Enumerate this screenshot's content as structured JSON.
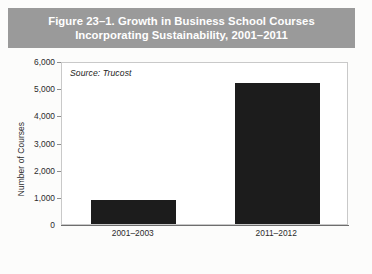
{
  "figure": {
    "title_line1": "Figure 23–1. Growth in Business School Courses",
    "title_line2": "Incorporating Sustainability, 2001–2011",
    "title_full": "Figure 23–1. Growth in Business School Courses\nIncorporating Sustainability, 2001–2011",
    "banner_color": "#9a9a9a",
    "title_color": "#ffffff",
    "background_color": "#fcfcfb"
  },
  "chart_data": {
    "type": "bar",
    "title": "Figure 23–1. Growth in Business School Courses Incorporating Sustainability, 2001–2011",
    "subtitle": "",
    "categories": [
      "2001–2003",
      "2011–2012"
    ],
    "values": [
      900,
      5200
    ],
    "series": [
      {
        "name": "Number of Courses",
        "values": [
          900,
          5200
        ]
      }
    ],
    "xlabel": "",
    "ylabel": "Number of Courses",
    "ylim": [
      0,
      6000
    ],
    "ytick_values": [
      0,
      1000,
      2000,
      3000,
      4000,
      5000,
      6000
    ],
    "ytick_labels": [
      "0",
      "1,000",
      "2,000",
      "3,000",
      "4,000",
      "5,000",
      "6,000"
    ],
    "grid": false,
    "legend": false,
    "legend_position": "none",
    "bar_color": "#1c1c1c",
    "plot_background": "#ffffff",
    "annotations": [
      {
        "name": "source-note",
        "text": "Source: Trucost",
        "style": "italic",
        "position": "top-left-inside-plot"
      }
    ]
  },
  "axis": {
    "y_title": "Number of Courses",
    "source_note": "Source: Trucost"
  }
}
